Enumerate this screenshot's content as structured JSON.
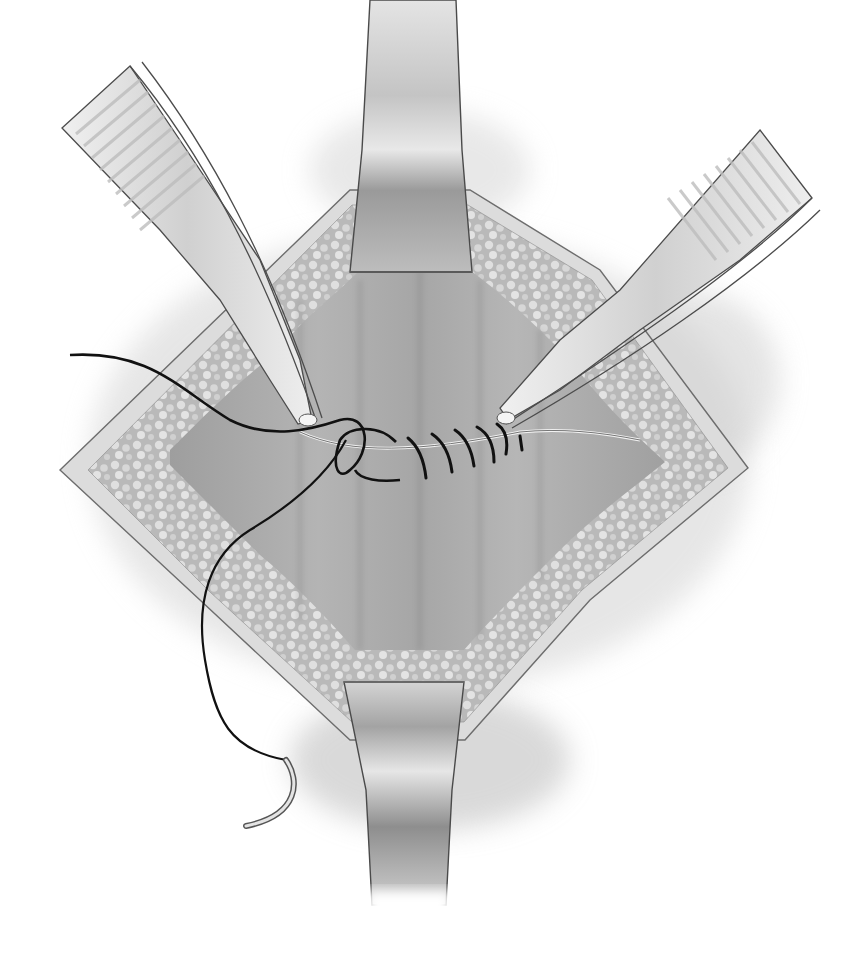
{
  "illustration": {
    "subject": "surgical wound closure with interrupted sutures",
    "style": "grayscale medical illustration",
    "colors": {
      "background": "#ffffff",
      "skin_shadow": "#c8c8c8",
      "wound_edge": "#d9d9d9",
      "fat_tissue": "#bdbdbd",
      "fat_highlight": "#e6e6e6",
      "cavity": "#a9a9a9",
      "instrument": "#e2e2e2",
      "instrument_outline": "#555555",
      "suture": "#111111"
    },
    "components": [
      {
        "name": "retractor-top",
        "label": "Upper retractor blade"
      },
      {
        "name": "retractor-bottom",
        "label": "Lower retractor blade"
      },
      {
        "name": "forceps-left",
        "label": "Left tissue forceps"
      },
      {
        "name": "forceps-right",
        "label": "Right tissue forceps"
      },
      {
        "name": "incision",
        "label": "Diamond-shaped incision with subcutaneous fat"
      },
      {
        "name": "suture-line",
        "label": "Row of interrupted sutures"
      },
      {
        "name": "suture-thread",
        "label": "Free suture thread"
      },
      {
        "name": "needle",
        "label": "Curved surgical needle"
      }
    ],
    "suture_count": 5
  }
}
